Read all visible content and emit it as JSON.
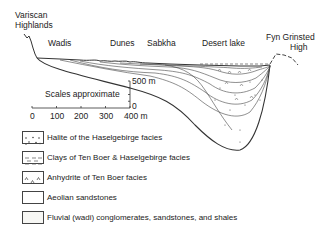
{
  "diagram": {
    "labels": {
      "highlands_line1": "Variscan",
      "highlands_line2": "Highlands",
      "wadis": "Wadis",
      "dunes": "Dunes",
      "sabkha": "Sabkha",
      "desert_lake": "Desert lake",
      "high_line1": "Fyn Grinsted",
      "high_line2": "High"
    },
    "scale": {
      "caption": "Scales approximate",
      "vertical_top": "500 m",
      "vertical_bottom": "0",
      "horizontal_ticks": [
        "0",
        "100",
        "200",
        "300",
        "400 m"
      ]
    },
    "legend": [
      {
        "pattern": "halite-dots",
        "label": "Halite of the Haselgebirge facies"
      },
      {
        "pattern": "clay-dashes",
        "label": "Clays of Ten Boer & Haselgebirge facies"
      },
      {
        "pattern": "anhydrite-carets",
        "label": "Anhydrite of Ten Boer facies"
      },
      {
        "pattern": "blank",
        "label": "Aeolian sandstones"
      },
      {
        "pattern": "blank-stippled",
        "label": "Fluvial (wadi) conglomerates, sandstones, and shales"
      }
    ],
    "colors": {
      "line": "#333333",
      "background": "#ffffff"
    }
  }
}
